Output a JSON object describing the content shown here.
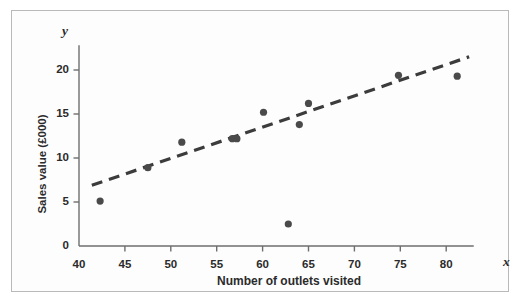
{
  "chart_data": {
    "type": "scatter",
    "title": "",
    "xlabel": "Number of outlets visited",
    "ylabel": "Sales value (£000)",
    "x_axis_symbol": "x",
    "y_axis_symbol": "y",
    "xlim": [
      40,
      83
    ],
    "ylim": [
      0,
      22.8
    ],
    "xticks": [
      40,
      45,
      50,
      55,
      60,
      65,
      70,
      75,
      80
    ],
    "yticks": [
      0,
      5,
      10,
      15,
      20
    ],
    "grid": false,
    "legend": null,
    "point_color": "#4a4a4a",
    "trendline_color": "#3c3c3c",
    "axis_color": "#6e6e6e",
    "points": [
      {
        "x": 42.3,
        "y": 5.1
      },
      {
        "x": 47.5,
        "y": 8.9
      },
      {
        "x": 51.2,
        "y": 11.8
      },
      {
        "x": 56.7,
        "y": 12.2
      },
      {
        "x": 57.2,
        "y": 12.2
      },
      {
        "x": 60.1,
        "y": 15.2
      },
      {
        "x": 62.8,
        "y": 2.5
      },
      {
        "x": 64.0,
        "y": 13.8
      },
      {
        "x": 65.0,
        "y": 16.2
      },
      {
        "x": 74.8,
        "y": 19.4
      },
      {
        "x": 81.2,
        "y": 19.3
      }
    ],
    "trendline": {
      "style": "dashed",
      "x_start": 41.4,
      "y_start": 6.9,
      "x_end": 82.5,
      "y_end": 21.5
    }
  }
}
